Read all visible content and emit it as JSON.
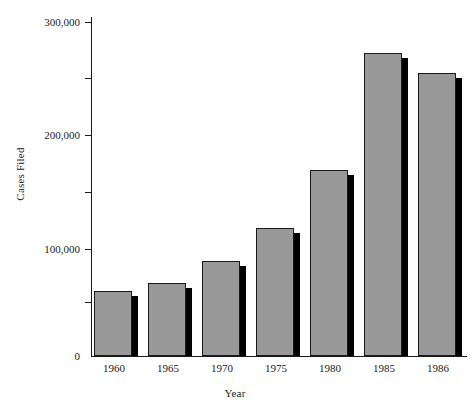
{
  "chart_data": {
    "type": "bar",
    "title": "",
    "xlabel": "Year",
    "ylabel": "Cases Filed",
    "categories": [
      "1960",
      "1965",
      "1970",
      "1975",
      "1980",
      "1985",
      "1986"
    ],
    "values": [
      58000,
      66000,
      85000,
      115000,
      167000,
      272000,
      254000
    ],
    "ylim": [
      0,
      300000
    ],
    "ytick_values": [
      0,
      100000,
      200000,
      300000
    ],
    "ytick_labels": [
      "0",
      "100,000",
      "200,000",
      "300,000"
    ],
    "yminor_tick_values": [
      50000,
      150000,
      250000
    ],
    "grid": false,
    "legend": null,
    "series": [
      {
        "name": "Cases Filed",
        "values": [
          58000,
          66000,
          85000,
          115000,
          167000,
          272000,
          254000
        ]
      }
    ],
    "style": {
      "bar_fill": "#999999",
      "bar_outline": "#1a1a1a",
      "bar_shadow": "#000000",
      "background": "#ffffff",
      "axis_color": "#1a1a1a"
    }
  }
}
